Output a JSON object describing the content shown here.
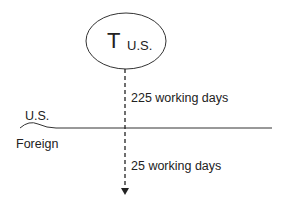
{
  "diagram": {
    "node": {
      "main": "T",
      "subscript": "U.S."
    },
    "edges": [
      {
        "label": "225 working days",
        "region": "U.S."
      },
      {
        "label": "25 working days",
        "region": "Foreign"
      }
    ],
    "regions": {
      "upper": "U.S.",
      "lower": "Foreign"
    },
    "colors": {
      "stroke": "#333333",
      "text": "#222222",
      "background": "#ffffff"
    }
  }
}
